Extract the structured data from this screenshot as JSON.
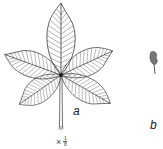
{
  "figure": {
    "leaflet_count": 5,
    "labels": {
      "a": "a",
      "b": "b"
    },
    "scale": {
      "prefix": "×",
      "numerator": "1",
      "denominator": "8"
    }
  },
  "colors": {
    "line": "#333333",
    "background": "#ffffff"
  }
}
